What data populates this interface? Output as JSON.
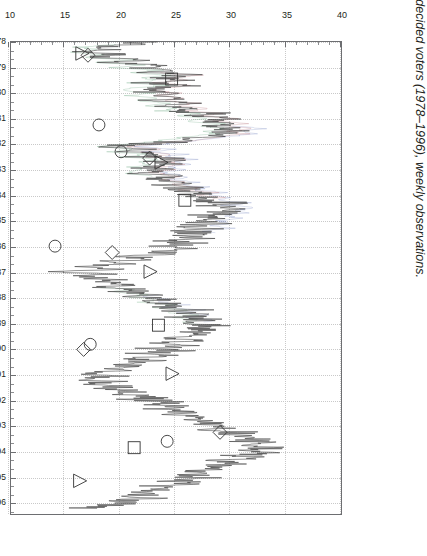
{
  "figure": {
    "caption_number": "Figure 4.2",
    "caption_text": "Percentage of undecided voters (1978–1996), weekly observations."
  },
  "colors": {
    "frame": "#6d6e71",
    "grid": "#c9c9c9",
    "series_main": "#3a3a3a",
    "series_alt_green": "#4f9a6a",
    "series_alt_red": "#a04550",
    "series_alt_blue": "#4a5ea8",
    "marker_stroke": "#333333",
    "text": "#231f20",
    "background": "#ffffff"
  },
  "chart_data": {
    "type": "line",
    "title": "Percentage of undecided voters (1978–1996), weekly observations.",
    "xlabel": "",
    "ylabel": "",
    "orientation": "rotated-90-ccw",
    "grid": true,
    "legend_position": "none",
    "xlim": [
      1978,
      1996.5
    ],
    "ylim": [
      10,
      40
    ],
    "yticks": [
      40,
      35,
      30,
      25,
      20,
      15,
      10
    ],
    "ytick_labels": [
      "40",
      "35",
      "30",
      "25",
      "20",
      "15",
      "10"
    ],
    "y_minor_ticks_per_major": 5,
    "xticks": [
      1978,
      1979,
      1980,
      1981,
      1982,
      1983,
      1984,
      1985,
      1986,
      1987,
      1988,
      1989,
      1990,
      1991,
      1992,
      1993,
      1994,
      1995,
      1996
    ],
    "xtick_labels": [
      "1978",
      "1979",
      "1980",
      "1981",
      "1982",
      "1983",
      "1984",
      "1985",
      "1986",
      "1987",
      "1988",
      "1989",
      "1990",
      "1991",
      "1992",
      "1993",
      "1994",
      "1995",
      "1996"
    ],
    "series": [
      {
        "name": "undecided voters (weekly)",
        "color": "#3a3a3a",
        "x": [
          1978.0,
          1978.1,
          1978.2,
          1978.3,
          1978.4,
          1978.5,
          1978.6,
          1978.7,
          1978.8,
          1978.9,
          1979.0,
          1979.1,
          1979.2,
          1979.3,
          1979.4,
          1979.5,
          1979.6,
          1979.7,
          1979.8,
          1979.9,
          1980.0,
          1980.1,
          1980.2,
          1980.3,
          1980.4,
          1980.5,
          1980.6,
          1980.7,
          1980.8,
          1980.9,
          1981.0,
          1981.1,
          1981.2,
          1981.3,
          1981.4,
          1981.5,
          1981.6,
          1981.7,
          1981.8,
          1981.9,
          1982.0,
          1982.1,
          1982.2,
          1982.3,
          1982.4,
          1982.5,
          1982.6,
          1982.7,
          1982.8,
          1982.9,
          1983.0,
          1983.1,
          1983.2,
          1983.3,
          1983.4,
          1983.5,
          1983.6,
          1983.7,
          1983.8,
          1983.9,
          1984.0,
          1984.1,
          1984.2,
          1984.3,
          1984.4,
          1984.5,
          1984.6,
          1984.7,
          1984.8,
          1984.9,
          1985.0,
          1985.1,
          1985.2,
          1985.3,
          1985.4,
          1985.5,
          1985.6,
          1985.7,
          1985.8,
          1985.9,
          1986.0,
          1986.1,
          1986.2,
          1986.3,
          1986.4,
          1986.5,
          1986.6,
          1986.7,
          1986.8,
          1986.9,
          1987.0,
          1987.1,
          1987.2,
          1987.3,
          1987.4,
          1987.5,
          1987.6,
          1987.7,
          1987.8,
          1987.9,
          1988.0,
          1988.1,
          1988.2,
          1988.3,
          1988.4,
          1988.5,
          1988.6,
          1988.7,
          1988.8,
          1988.9,
          1989.0,
          1989.1,
          1989.2,
          1989.3,
          1989.4,
          1989.5,
          1989.6,
          1989.7,
          1989.8,
          1989.9,
          1990.0,
          1990.1,
          1990.2,
          1990.3,
          1990.4,
          1990.5,
          1990.6,
          1990.7,
          1990.8,
          1990.9,
          1991.0,
          1991.1,
          1991.2,
          1991.3,
          1991.4,
          1991.5,
          1991.6,
          1991.7,
          1991.8,
          1991.9,
          1992.0,
          1992.1,
          1992.2,
          1992.3,
          1992.4,
          1992.5,
          1992.6,
          1992.7,
          1992.8,
          1992.9,
          1993.0,
          1993.1,
          1993.2,
          1993.3,
          1993.4,
          1993.5,
          1993.6,
          1993.7,
          1993.8,
          1993.9,
          1994.0,
          1994.1,
          1994.2,
          1994.3,
          1994.4,
          1994.5,
          1994.6,
          1994.7,
          1994.8,
          1994.9,
          1995.0,
          1995.1,
          1995.2,
          1995.3,
          1995.4,
          1995.5,
          1995.6,
          1995.7,
          1995.8,
          1995.9,
          1996.0,
          1996.1,
          1996.2,
          1996.3
        ],
        "y": [
          22.0,
          21.2,
          17.5,
          19.8,
          16.6,
          20.4,
          18.2,
          22.6,
          19.0,
          23.3,
          21.0,
          25.0,
          22.3,
          26.2,
          23.5,
          24.8,
          22.0,
          25.6,
          23.0,
          21.6,
          24.2,
          22.4,
          25.0,
          23.0,
          26.0,
          24.1,
          27.0,
          25.2,
          28.4,
          26.5,
          29.8,
          27.6,
          30.6,
          28.8,
          31.0,
          29.2,
          30.4,
          28.0,
          26.4,
          24.6,
          22.2,
          19.4,
          22.8,
          20.6,
          24.0,
          22.0,
          25.0,
          23.2,
          24.4,
          22.6,
          23.8,
          21.9,
          23.2,
          24.6,
          22.8,
          25.2,
          23.6,
          26.4,
          24.8,
          27.6,
          25.8,
          28.6,
          26.8,
          29.6,
          27.8,
          30.4,
          28.6,
          29.8,
          27.4,
          29.0,
          26.8,
          28.4,
          26.0,
          28.0,
          25.6,
          27.2,
          25.0,
          27.0,
          24.6,
          26.2,
          23.8,
          25.4,
          22.6,
          24.0,
          20.4,
          22.4,
          18.8,
          21.0,
          16.8,
          19.6,
          14.0,
          17.8,
          16.0,
          19.0,
          17.4,
          20.6,
          18.6,
          21.8,
          20.0,
          23.0,
          21.4,
          24.2,
          22.6,
          25.4,
          23.6,
          26.6,
          24.8,
          27.4,
          25.6,
          28.0,
          26.2,
          28.6,
          26.8,
          28.2,
          26.4,
          27.6,
          25.2,
          26.8,
          24.4,
          26.0,
          23.6,
          25.2,
          22.4,
          24.0,
          21.2,
          22.8,
          19.8,
          21.4,
          18.4,
          20.0,
          17.0,
          18.8,
          16.4,
          19.2,
          17.6,
          20.4,
          18.8,
          21.6,
          20.0,
          22.8,
          21.4,
          24.0,
          22.6,
          25.2,
          23.8,
          26.4,
          25.0,
          27.6,
          26.2,
          28.8,
          27.4,
          30.0,
          28.6,
          31.2,
          29.8,
          32.4,
          30.6,
          33.0,
          31.2,
          34.0,
          31.8,
          33.2,
          30.6,
          31.8,
          29.4,
          30.8,
          28.2,
          29.6,
          27.0,
          28.4,
          25.8,
          27.2,
          24.6,
          26.0,
          23.4,
          24.8,
          22.2,
          23.6,
          21.0,
          22.4,
          19.8,
          21.2,
          18.6,
          16.2
        ]
      },
      {
        "name": "auxiliary trace (green)",
        "color": "#4f9a6a",
        "note": "faint overprinted trace, lower portion 1978–1983"
      },
      {
        "name": "auxiliary trace (red)",
        "color": "#a04550",
        "note": "faint overprinted trace, 1979–1984"
      },
      {
        "name": "auxiliary trace (blue)",
        "color": "#4a5ea8",
        "note": "faint overprinted trace, 1981–1985 and 1988"
      }
    ],
    "markers": [
      {
        "shape": "triangle",
        "x": 1978.45,
        "y": 16.4
      },
      {
        "shape": "diamond",
        "x": 1978.52,
        "y": 17.0
      },
      {
        "shape": "square",
        "x": 1979.45,
        "y": 24.6
      },
      {
        "shape": "circle",
        "x": 1981.25,
        "y": 18.0
      },
      {
        "shape": "circle",
        "x": 1982.3,
        "y": 20.0
      },
      {
        "shape": "diamond",
        "x": 1982.55,
        "y": 22.6
      },
      {
        "shape": "triangle",
        "x": 1982.72,
        "y": 23.6
      },
      {
        "shape": "square",
        "x": 1984.2,
        "y": 25.8
      },
      {
        "shape": "circle",
        "x": 1986.0,
        "y": 14.0
      },
      {
        "shape": "diamond",
        "x": 1986.25,
        "y": 19.2
      },
      {
        "shape": "triangle",
        "x": 1987.0,
        "y": 22.6
      },
      {
        "shape": "square",
        "x": 1989.1,
        "y": 23.4
      },
      {
        "shape": "circle",
        "x": 1989.85,
        "y": 17.2
      },
      {
        "shape": "diamond",
        "x": 1990.05,
        "y": 16.6
      },
      {
        "shape": "triangle",
        "x": 1991.0,
        "y": 24.6
      },
      {
        "shape": "diamond",
        "x": 1993.3,
        "y": 29.0
      },
      {
        "shape": "circle",
        "x": 1993.65,
        "y": 24.2
      },
      {
        "shape": "square",
        "x": 1993.9,
        "y": 21.2
      },
      {
        "shape": "triangle",
        "x": 1995.2,
        "y": 16.2
      }
    ]
  }
}
